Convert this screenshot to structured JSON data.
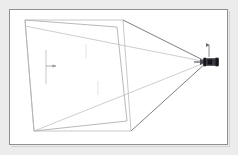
{
  "figure": {
    "title": "Perspective projection diagram",
    "description": "Line-art technical drawing: a quadrilateral ground plane at left with sight lines converging to a small vehicle at the right vanishing point.",
    "background_color": "#ececec",
    "panel_color": "#ffffff",
    "frame_border_color": "#8e8e93",
    "line_color_light": "#b9b9bd",
    "line_color_dark": "#6e6e76",
    "vehicle_color": "#2b2b2e"
  },
  "geometry": {
    "panel": {
      "x": 9,
      "y": 9,
      "width": 219,
      "height": 136
    },
    "vanishing_point": {
      "x": 207,
      "y": 62
    },
    "near_quad": {
      "label": "near plane quadrilateral",
      "points": [
        {
          "x": 25,
          "y": 20
        },
        {
          "x": 123,
          "y": 20
        },
        {
          "x": 131,
          "y": 131
        },
        {
          "x": 34,
          "y": 131
        }
      ]
    },
    "far_quad": {
      "label": "far plane quadrilateral",
      "points": [
        {
          "x": 25,
          "y": 20
        },
        {
          "x": 117,
          "y": 27
        },
        {
          "x": 127,
          "y": 121
        },
        {
          "x": 34,
          "y": 131
        }
      ]
    },
    "sight_lines": [
      {
        "name": "sight-line-top",
        "from": {
          "x": 123,
          "y": 20
        },
        "to": {
          "x": 207,
          "y": 62
        },
        "weight": "dark"
      },
      {
        "name": "sight-line-upper-mid",
        "from": {
          "x": 25,
          "y": 26
        },
        "to": {
          "x": 207,
          "y": 62
        },
        "weight": "light"
      },
      {
        "name": "sight-line-lower-mid",
        "from": {
          "x": 34,
          "y": 131
        },
        "to": {
          "x": 207,
          "y": 62
        },
        "weight": "light"
      },
      {
        "name": "sight-line-bottom",
        "from": {
          "x": 131,
          "y": 131
        },
        "to": {
          "x": 207,
          "y": 62
        },
        "weight": "dark"
      }
    ],
    "tick_marks": [
      {
        "name": "tick-mark-left",
        "x": 46,
        "y1": 50,
        "y2": 84,
        "weight": "light"
      },
      {
        "name": "tick-mark-upper",
        "x": 86,
        "y1": 44,
        "y2": 58,
        "weight": "faint"
      },
      {
        "name": "tick-mark-lower",
        "x": 98,
        "y1": 81,
        "y2": 95,
        "weight": "faint"
      }
    ],
    "marker_arrow": {
      "name": "plane-normal-arrow",
      "x1": 46,
      "y1": 66,
      "x2": 56,
      "y2": 66
    },
    "vehicle": {
      "name": "vehicle",
      "center": {
        "x": 211,
        "y": 62
      },
      "width": 15,
      "height": 7,
      "antenna": {
        "x": 209,
        "y1": 45,
        "y2": 57
      },
      "approach_arrow": {
        "x1": 194,
        "y1": 62,
        "x2": 205,
        "y2": 62
      }
    }
  }
}
